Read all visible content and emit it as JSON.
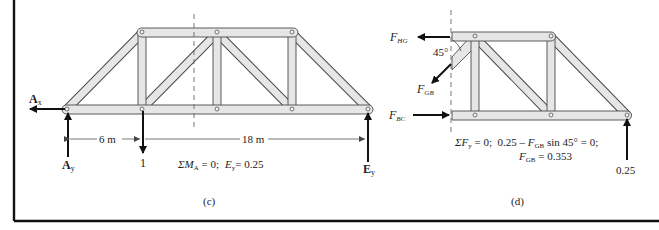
{
  "figure": {
    "panel_c": {
      "caption": "(c)",
      "labels": {
        "Ax": "A",
        "Ax_sub": "x",
        "Ay": "A",
        "Ay_sub": "y",
        "Ey": "E",
        "Ey_sub": "y",
        "load": "1",
        "dim_left": "6 m",
        "dim_right": "18 m"
      },
      "equation": {
        "sum_part": "ΣM",
        "sum_sub": "A",
        "eq_rest": " = 0;",
        "result_var": "E",
        "result_sub": "y",
        "result_value": "= 0.25"
      }
    },
    "panel_d": {
      "caption": "(d)",
      "labels": {
        "F_HG": "F",
        "F_HG_sub": "HG",
        "F_GB": "F",
        "F_GB_sub": "GB",
        "F_BC": "F",
        "F_BC_sub": "BC",
        "angle": "45°",
        "reaction": "0.25"
      },
      "equation_line1": {
        "sum_part": "ΣF",
        "sum_sub": "y",
        "rest1": " = 0;  0.25 – ",
        "var": "F",
        "var_sub": "GB",
        "rest2": " sin 45° = 0;"
      },
      "equation_line2": {
        "var": "F",
        "var_sub": "GB",
        "rest": " = 0.353"
      }
    }
  }
}
